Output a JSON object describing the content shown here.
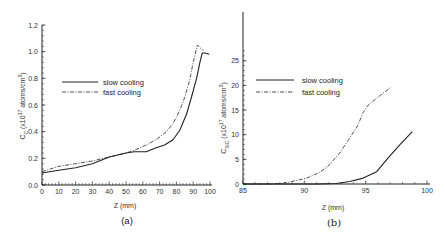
{
  "chart_data": [
    {
      "type": "line",
      "panel_label": "(a)",
      "title": "",
      "xlabel": "Z (mm)",
      "ylabel": "C_C (x10^17 atoms/cm^3)",
      "ylabel_parts": {
        "main": "C",
        "sub": "C",
        "mid": " (x10",
        "sup1": "17",
        "rest": " atoms/cm",
        "sup2": "3",
        "end": ")"
      },
      "xlim": [
        0,
        100
      ],
      "ylim": [
        0,
        1.2
      ],
      "xticks": [
        0,
        10,
        20,
        30,
        40,
        50,
        60,
        70,
        80,
        90,
        100
      ],
      "xtick_labels": [
        "0",
        "10",
        "20",
        "30",
        "40",
        "50",
        "60",
        "70",
        "80",
        "90",
        "100"
      ],
      "yticks": [
        0,
        0.2,
        0.4,
        0.6,
        0.8,
        1.0,
        1.2
      ],
      "ytick_labels": [
        "0.0",
        "0.2",
        "0.4",
        "0.6",
        "0.8",
        "1.0",
        "1.2"
      ],
      "grid": false,
      "legend_position": "upper left",
      "series": [
        {
          "name": "slow cooling",
          "style": "solid",
          "x": [
            0,
            10,
            20,
            30,
            40,
            50,
            55,
            62,
            68,
            73,
            78,
            82,
            86,
            89,
            92,
            94,
            95.4,
            97,
            99.6
          ],
          "y": [
            0.09,
            0.11,
            0.13,
            0.16,
            0.21,
            0.24,
            0.25,
            0.25,
            0.28,
            0.3,
            0.34,
            0.41,
            0.53,
            0.66,
            0.8,
            0.92,
            0.99,
            0.99,
            0.98
          ]
        },
        {
          "name": "fast cooling",
          "style": "dashdot",
          "x": [
            0,
            10,
            20,
            30,
            40,
            50,
            55,
            62,
            68,
            74,
            78,
            82,
            85,
            88,
            90,
            92.5,
            94,
            96
          ],
          "y": [
            0.1,
            0.14,
            0.16,
            0.18,
            0.21,
            0.24,
            0.26,
            0.3,
            0.34,
            0.4,
            0.46,
            0.56,
            0.66,
            0.79,
            0.92,
            1.05,
            1.03,
            1.01
          ]
        }
      ]
    },
    {
      "type": "line",
      "panel_label": "(b)",
      "title": "",
      "xlabel": "Z (mm)",
      "ylabel": "C_SiC (x10^17 atoms/cm^3)",
      "ylabel_parts": {
        "main": "C",
        "sub": "SiC",
        "mid": " (x10",
        "sup1": "17",
        "rest": " atoms/cm",
        "sup2": "3",
        "end": ")"
      },
      "xlim": [
        85,
        100
      ],
      "ylim": [
        0,
        35
      ],
      "xticks": [
        85,
        90,
        95,
        100
      ],
      "xtick_labels": [
        "85",
        "90",
        "95",
        "100"
      ],
      "yticks": [
        0,
        5,
        10,
        15,
        20,
        25
      ],
      "ytick_labels": [
        "0",
        "5",
        "10",
        "15",
        "20",
        "25"
      ],
      "grid": false,
      "legend_position": "upper left",
      "series": [
        {
          "name": "slow cooling",
          "style": "solid",
          "x": [
            85,
            88,
            91,
            92.6,
            93.7,
            94.8,
            95.9,
            96.8,
            97.8,
            98.8
          ],
          "y": [
            0,
            0,
            0,
            0.1,
            0.5,
            1.2,
            2.5,
            5.2,
            8.0,
            10.6
          ]
        },
        {
          "name": "fast cooling",
          "style": "dashdot",
          "x": [
            85,
            87,
            88,
            88.8,
            90.2,
            91.2,
            91.9,
            92.9,
            93.6,
            94.3,
            94.8,
            95.2,
            96.2,
            97.1
          ],
          "y": [
            0,
            0,
            0.1,
            0.4,
            1.2,
            2.3,
            3.5,
            6.3,
            9.0,
            11.6,
            14.5,
            16.0,
            18.0,
            19.7
          ]
        }
      ]
    }
  ],
  "panels": {
    "a": {
      "label": "(a)",
      "xlabel": "Z (mm)",
      "legend": [
        "slow cooling",
        "fast cooling"
      ]
    },
    "b": {
      "label": "(b)",
      "xlabel": "Z (mm)",
      "legend": [
        "slow cooling",
        "fast cooling"
      ]
    }
  }
}
